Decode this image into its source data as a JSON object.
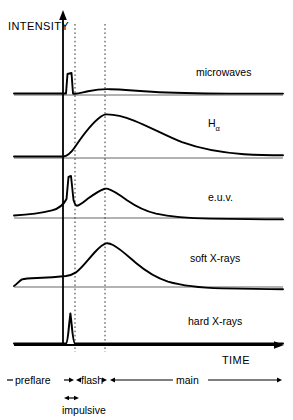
{
  "figure": {
    "axes": {
      "y_axis_label": "INTENSITY",
      "x_axis_label": "TIME"
    },
    "traces": [
      {
        "id": "microwaves",
        "label": "microwaves",
        "baseline_y": 95,
        "label_x": 196,
        "label_y": 76
      },
      {
        "id": "h-alpha",
        "label": "H",
        "sublabel": "α",
        "baseline_y": 158,
        "label_x": 208,
        "label_y": 127
      },
      {
        "id": "euv",
        "label": "e.u.v.",
        "baseline_y": 218,
        "label_x": 208,
        "label_y": 201
      },
      {
        "id": "soft-x-rays",
        "label": "soft X-rays",
        "baseline_y": 287,
        "label_x": 190,
        "label_y": 262
      },
      {
        "id": "hard-x-rays",
        "label": "hard X-rays",
        "baseline_y": 345,
        "label_x": 188,
        "label_y": 325
      }
    ],
    "guides": {
      "y_axis_x": 63,
      "dotted_line_1_x": 75,
      "dotted_line_2_x": 105,
      "plot_right_x": 283,
      "plot_top_y": 14
    },
    "phases": [
      {
        "id": "preflare",
        "label": "preflare",
        "label_x": 42,
        "label_y": 383,
        "start_x": 6,
        "end_x": 63
      },
      {
        "id": "flash",
        "label": "flash",
        "label_x": 86,
        "label_y": 383,
        "start_x": 63,
        "end_x": 108
      },
      {
        "id": "main",
        "label": "main",
        "label_x": 190,
        "label_y": 383,
        "start_x": 111,
        "end_x": 283
      },
      {
        "id": "impulsive",
        "label": "impulsive",
        "label_x": 99,
        "label_y": 412,
        "start_x": 64,
        "end_x": 80
      }
    ],
    "colors": {
      "curve": "#000000",
      "axis": "#000000",
      "baseline": "#555555",
      "dotted_guide": "#333333",
      "background": "#ffffff"
    }
  }
}
